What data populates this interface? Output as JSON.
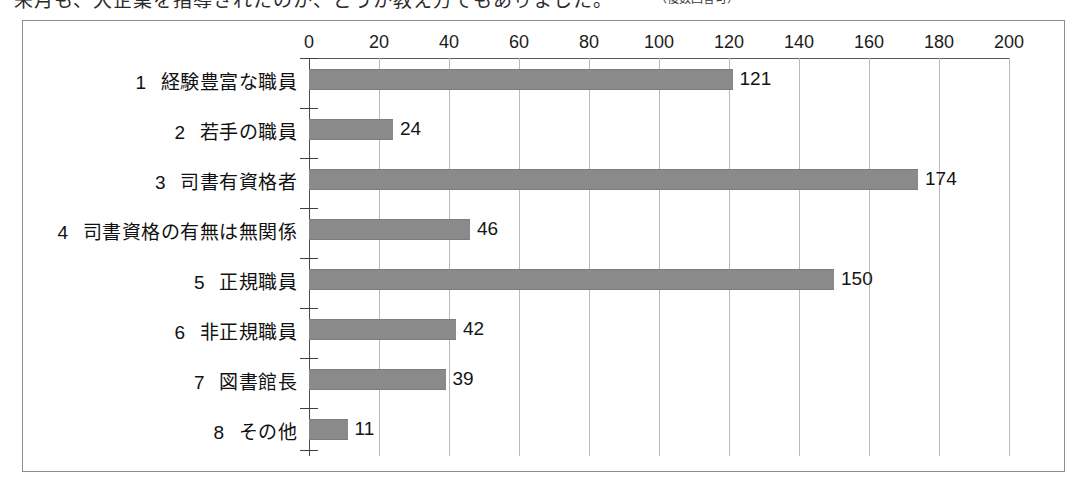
{
  "caption": {
    "text": "来月も、大企業を指導されたのか、どうか教え方でもありました。",
    "note": "（複数回答可）"
  },
  "chart_data": {
    "type": "bar",
    "orientation": "horizontal",
    "title": "",
    "xlabel": "",
    "ylabel": "",
    "xlim": [
      0,
      200
    ],
    "xticks": [
      0,
      20,
      40,
      60,
      80,
      100,
      120,
      140,
      160,
      180,
      200
    ],
    "grid": true,
    "grid_axis": "x",
    "legend": false,
    "bar_color": "#8a8a8a",
    "axis_color": "#4a4a4a",
    "grid_color": "#b9b9b9",
    "categories": [
      "経験豊富な職員",
      "若手の職員",
      "司書有資格者",
      "司書資格の有無は無関係",
      "正規職員",
      "非正規職員",
      "図書館長",
      "その他"
    ],
    "category_numbers": [
      "1",
      "2",
      "3",
      "4",
      "5",
      "6",
      "7",
      "8"
    ],
    "values": [
      121,
      24,
      174,
      46,
      150,
      42,
      39,
      11
    ],
    "value_labels": [
      "121",
      "24",
      "174",
      "46",
      "150",
      "42",
      "39",
      "11"
    ]
  }
}
